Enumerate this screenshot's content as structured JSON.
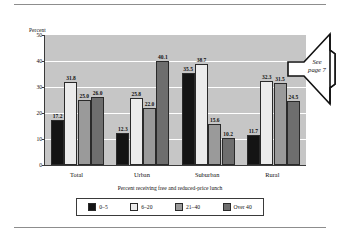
{
  "chart_data": {
    "type": "bar",
    "title": "",
    "xlabel": "Percent receiving free and reduced-price lunch",
    "ylabel": "Percent",
    "categories": [
      "Total",
      "Urban",
      "Suburban",
      "Rural"
    ],
    "ylim": [
      0,
      50
    ],
    "yticks": [
      "0",
      "10",
      "20",
      "30",
      "40",
      "50"
    ],
    "grid": true,
    "legend_position": "bottom",
    "series": [
      {
        "name": "0–5",
        "color": "#141414",
        "values": [
          17.2,
          12.3,
          35.5,
          11.7
        ]
      },
      {
        "name": "6–20",
        "color": "#ececec",
        "values": [
          31.8,
          25.8,
          38.7,
          32.3
        ]
      },
      {
        "name": "21–40",
        "color": "#9a9a9a",
        "values": [
          25.0,
          22.0,
          15.6,
          31.5
        ]
      },
      {
        "name": "Over 40",
        "color": "#6e6e6e",
        "values": [
          26.0,
          40.1,
          10.2,
          24.5
        ]
      }
    ],
    "value_labels": [
      [
        "17.2",
        "31.8",
        "25.0",
        "26.0"
      ],
      [
        "12.3",
        "25.8",
        "22.0",
        "40.1"
      ],
      [
        "35.5",
        "38.7",
        "15.6",
        "10.2"
      ],
      [
        "11.7",
        "32.3",
        "31.5",
        "24.5"
      ]
    ],
    "plot_background": "#c6c6c6",
    "gridline_color": "#ffffff"
  },
  "callout": {
    "line1": "See",
    "line2": "page 7"
  }
}
